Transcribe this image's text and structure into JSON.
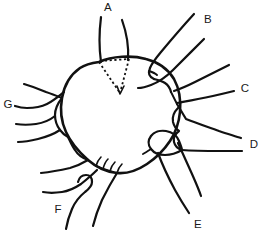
{
  "figure": {
    "caption": "",
    "width": 264,
    "height": 243,
    "background_color": "#ffffff",
    "ink_color": "#111111",
    "label_color": "#1a1a1a",
    "style": "black-and-white hand-drawn ink line art, no shading"
  },
  "central_body": {
    "name": "central-body",
    "shape": "irregular circle",
    "center": {
      "x": 121,
      "y": 115
    },
    "radius_x": 59,
    "radius_y": 60,
    "fill": "none",
    "stroke": "#111111"
  },
  "dotted_marker": {
    "name": "dotted-triangle-marker",
    "shape": "triangle with dotted edges, apex pointing down",
    "apex": {
      "x": 120,
      "y": 93
    },
    "top_left": {
      "x": 99,
      "y": 62
    },
    "top_right": {
      "x": 129,
      "y": 59
    },
    "stroke_style": "dotted",
    "points_to_label": "A"
  },
  "teeth": {
    "name": "comb-teeth-cluster",
    "count": 4,
    "location": "lower-left edge of central body",
    "description": "small hook-shaped teeth along the body margin"
  },
  "labels": [
    {
      "id": "A",
      "text": "A",
      "x": 108,
      "y": 8,
      "appendage": "dorsal paired spine (two long tapering processes rising from the top of the body)",
      "position": "top-center"
    },
    {
      "id": "B",
      "text": "B",
      "x": 208,
      "y": 20,
      "appendage": "thick tapered claw-like appendage angled up-right",
      "position": "upper-right"
    },
    {
      "id": "C",
      "text": "C",
      "x": 245,
      "y": 89,
      "appendage": "slender two-line appendage projecting right",
      "position": "right-upper"
    },
    {
      "id": "D",
      "text": "D",
      "x": 254,
      "y": 145,
      "appendage": "broad appendage with bulbous base tapering outward to the right",
      "position": "right-lower"
    },
    {
      "id": "E",
      "text": "E",
      "x": 198,
      "y": 225,
      "appendage": "appendage with rounded bulbous base extending down-right",
      "position": "lower-right"
    },
    {
      "id": "F",
      "text": "F",
      "x": 58,
      "y": 210,
      "appendage": "hooked appendage with small loop, directed down-left",
      "position": "lower-left"
    },
    {
      "id": "G",
      "text": "G",
      "x": 8,
      "y": 105,
      "appendage": "forked bifurcate claw with deep notch, directed left",
      "position": "left"
    }
  ],
  "appendage_count": 7,
  "label_sequence": "A, B, C, D, E, F, G"
}
